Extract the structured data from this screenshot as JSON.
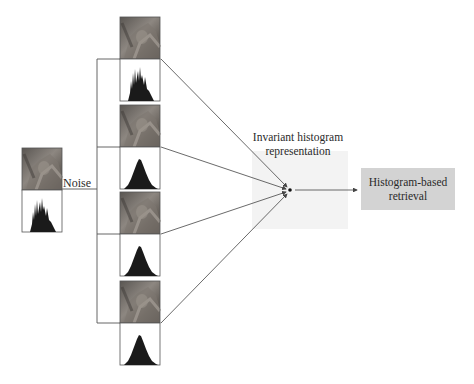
{
  "diagram": {
    "input": {
      "label": "Noise",
      "image": "lena-photo-original",
      "histogram": "spiky-histogram"
    },
    "noisy_variants": [
      {
        "image": "lena-photo-variant-1",
        "histogram": "spiky-histogram"
      },
      {
        "image": "lena-photo-variant-2",
        "histogram": "smooth-peak-histogram"
      },
      {
        "image": "lena-photo-variant-3",
        "histogram": "smooth-peak-histogram"
      },
      {
        "image": "lena-photo-variant-4",
        "histogram": "smooth-peak-histogram"
      }
    ],
    "representation": {
      "label_line1": "Invariant histogram",
      "label_line2": "representation"
    },
    "output": {
      "label_line1": "Histogram-based",
      "label_line2": "retrieval"
    },
    "colors": {
      "line": "#555555",
      "box_fill": "#d3d3d3",
      "faint_box_fill": "#f2f2f2",
      "histogram_fill": "#1a1a1a",
      "photo_base": "#6e6a66"
    }
  }
}
